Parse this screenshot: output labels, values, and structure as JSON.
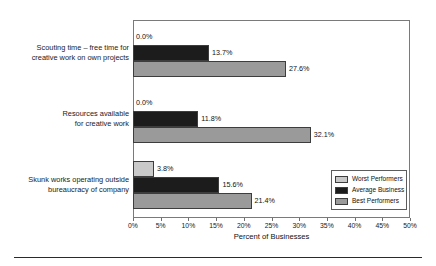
{
  "chart_data": {
    "type": "bar",
    "orientation": "horizontal",
    "title": "",
    "xlabel": "Percent of Businesses",
    "ylabel": "",
    "xlim": [
      0,
      50
    ],
    "xtick_labels": [
      "0%",
      "5%",
      "10%",
      "15%",
      "20%",
      "25%",
      "30%",
      "35%",
      "40%",
      "45%",
      "50%"
    ],
    "xtick_values": [
      0,
      5,
      10,
      15,
      20,
      25,
      30,
      35,
      40,
      45,
      50
    ],
    "grid": false,
    "legend_position": "lower-right",
    "categories": [
      "Scouting time – free time for creative work on own projects",
      "Resources available for creative work",
      "Skunk works operating outside bureaucracy of company"
    ],
    "category_lines": [
      [
        "Scouting time – free time for",
        "creative work on own projects"
      ],
      [
        "Resources available",
        "for creative work"
      ],
      [
        "Skunk works operating outside",
        "bureaucracy of company"
      ]
    ],
    "series": [
      {
        "name": "Worst Performers",
        "color": "#c9c9c9",
        "values": [
          0.0,
          0.0,
          3.8
        ],
        "labels": [
          "0.0%",
          "0.0%",
          "3.8%"
        ]
      },
      {
        "name": "Average Business",
        "color": "#1c1c1c",
        "values": [
          13.7,
          11.8,
          15.6
        ],
        "labels": [
          "13.7%",
          "11.8%",
          "15.6%"
        ]
      },
      {
        "name": "Best Performers",
        "color": "#9a9a9a",
        "values": [
          27.6,
          32.1,
          21.4
        ],
        "labels": [
          "27.6%",
          "32.1%",
          "21.4%"
        ]
      }
    ]
  },
  "legend": {
    "items": [
      {
        "label": "Worst Performers"
      },
      {
        "label": "Average Business"
      },
      {
        "label": "Best Performers"
      }
    ]
  },
  "axis": {
    "title": "Percent of Businesses"
  }
}
